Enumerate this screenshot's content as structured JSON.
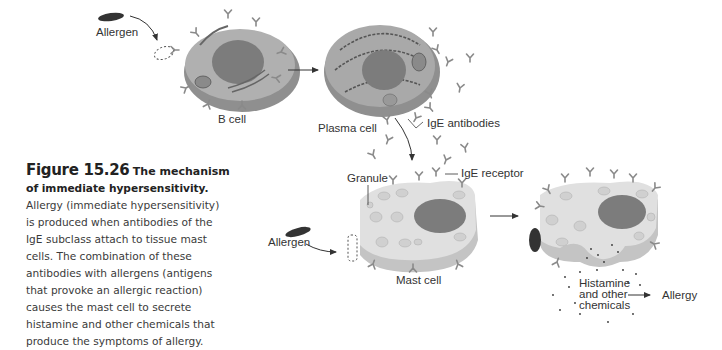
{
  "figure": {
    "number": "Figure 15.26",
    "title_line1": "The mechanism of",
    "title_line2": "immediate hypersensitivity.",
    "body": "Allergy (immediate hypersensitivity) is produced when antibodies of the IgE subclass attach to tissue mast cells. The combination of these antibodies with allergens (antigens that provoke an allergic reaction) causes the mast cell to secrete histamine and other chemicals that produce the symptoms of allergy."
  },
  "labels": {
    "allergen_top": "Allergen",
    "b_cell": "B cell",
    "plasma_cell": "Plasma cell",
    "ige_antibodies": "IgE antibodies",
    "granule": "Granule",
    "ige_receptor": "IgE receptor",
    "allergen_bottom": "Allergen",
    "mast_cell": "Mast cell",
    "histamine_1": "Histamine",
    "histamine_2": "and other",
    "histamine_3": "chemicals",
    "allergy": "Allergy"
  },
  "colors": {
    "cell_body": "#a9a9a9",
    "cell_side": "#8c8c8c",
    "nucleus": "#7a7a7a",
    "mast_body": "#dcdcdc",
    "antibody": "#888888",
    "allergen": "#333333"
  }
}
